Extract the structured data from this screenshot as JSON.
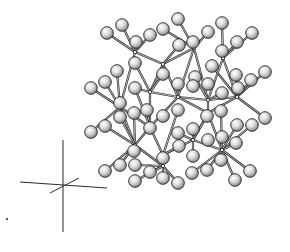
{
  "figure": {
    "title": "",
    "colors": {
      "background": "#ffffff",
      "atom_fill_light": "#f2f2f2",
      "atom_fill_dark": "#8a8a8a",
      "atom_outline": "#1f1f1f",
      "bond": "#2a2a2a",
      "axis": "#2b2b2b"
    },
    "atom_radius": 6.3,
    "atoms": [
      [
        107,
        33
      ],
      [
        122,
        25
      ],
      [
        136,
        42
      ],
      [
        150,
        35
      ],
      [
        163,
        29
      ],
      [
        178,
        19
      ],
      [
        193,
        42
      ],
      [
        208,
        32
      ],
      [
        222,
        23
      ],
      [
        252,
        33
      ],
      [
        237,
        42
      ],
      [
        222,
        51
      ],
      [
        179,
        45
      ],
      [
        135,
        63
      ],
      [
        117,
        71
      ],
      [
        195,
        77
      ],
      [
        212,
        66
      ],
      [
        236,
        75
      ],
      [
        265,
        72
      ],
      [
        251,
        80
      ],
      [
        91,
        88
      ],
      [
        105,
        82
      ],
      [
        135,
        88
      ],
      [
        163,
        74
      ],
      [
        178,
        84
      ],
      [
        193,
        86
      ],
      [
        208,
        84
      ],
      [
        222,
        93
      ],
      [
        238,
        88
      ],
      [
        221,
        111
      ],
      [
        207,
        116
      ],
      [
        178,
        110
      ],
      [
        163,
        116
      ],
      [
        147,
        110
      ],
      [
        134,
        113
      ],
      [
        120,
        103
      ],
      [
        265,
        118
      ],
      [
        252,
        125
      ],
      [
        237,
        125
      ],
      [
        91,
        132
      ],
      [
        105,
        126
      ],
      [
        120,
        117
      ],
      [
        150,
        128
      ],
      [
        178,
        133
      ],
      [
        193,
        129
      ],
      [
        208,
        140
      ],
      [
        222,
        137
      ],
      [
        236,
        143
      ],
      [
        134,
        151
      ],
      [
        163,
        158
      ],
      [
        193,
        156
      ],
      [
        179,
        146
      ],
      [
        105,
        171
      ],
      [
        120,
        165
      ],
      [
        135,
        165
      ],
      [
        150,
        172
      ],
      [
        192,
        173
      ],
      [
        207,
        170
      ],
      [
        221,
        160
      ],
      [
        235,
        180
      ],
      [
        250,
        171
      ],
      [
        135,
        181
      ],
      [
        178,
        183
      ],
      [
        163,
        178
      ]
    ],
    "nodes": [
      [
        135,
        52
      ],
      [
        194,
        48
      ],
      [
        223,
        58
      ],
      [
        163,
        64
      ],
      [
        150,
        92
      ],
      [
        120,
        107
      ],
      [
        178,
        97
      ],
      [
        208,
        100
      ],
      [
        237,
        97
      ],
      [
        150,
        127
      ],
      [
        208,
        113
      ],
      [
        135,
        145
      ],
      [
        193,
        140
      ],
      [
        163,
        155
      ],
      [
        222,
        150
      ],
      [
        163,
        166
      ]
    ],
    "bonds": [
      [
        107,
        33,
        135,
        52
      ],
      [
        122,
        25,
        135,
        52
      ],
      [
        136,
        42,
        135,
        52
      ],
      [
        150,
        35,
        135,
        52
      ],
      [
        178,
        19,
        194,
        48
      ],
      [
        193,
        42,
        194,
        48
      ],
      [
        208,
        32,
        194,
        48
      ],
      [
        163,
        29,
        194,
        48
      ],
      [
        222,
        23,
        223,
        58
      ],
      [
        237,
        42,
        223,
        58
      ],
      [
        252,
        33,
        223,
        58
      ],
      [
        222,
        51,
        223,
        58
      ],
      [
        135,
        52,
        163,
        64
      ],
      [
        194,
        48,
        163,
        64
      ],
      [
        179,
        45,
        163,
        64
      ],
      [
        163,
        64,
        150,
        92
      ],
      [
        163,
        64,
        178,
        97
      ],
      [
        135,
        52,
        120,
        107
      ],
      [
        135,
        63,
        150,
        92
      ],
      [
        117,
        71,
        120,
        107
      ],
      [
        91,
        88,
        120,
        107
      ],
      [
        105,
        82,
        120,
        107
      ],
      [
        194,
        48,
        178,
        97
      ],
      [
        194,
        48,
        208,
        100
      ],
      [
        195,
        77,
        208,
        100
      ],
      [
        212,
        66,
        237,
        97
      ],
      [
        223,
        58,
        237,
        97
      ],
      [
        223,
        58,
        208,
        100
      ],
      [
        265,
        72,
        237,
        97
      ],
      [
        251,
        80,
        237,
        97
      ],
      [
        236,
        75,
        237,
        97
      ],
      [
        150,
        92,
        178,
        97
      ],
      [
        178,
        97,
        208,
        100
      ],
      [
        208,
        100,
        237,
        97
      ],
      [
        150,
        92,
        135,
        88
      ],
      [
        163,
        74,
        150,
        92
      ],
      [
        120,
        107,
        150,
        127
      ],
      [
        150,
        92,
        150,
        127
      ],
      [
        178,
        97,
        150,
        127
      ],
      [
        178,
        97,
        208,
        113
      ],
      [
        208,
        100,
        208,
        113
      ],
      [
        237,
        97,
        208,
        113
      ],
      [
        120,
        107,
        135,
        145
      ],
      [
        91,
        132,
        120,
        107
      ],
      [
        105,
        126,
        135,
        145
      ],
      [
        120,
        117,
        135,
        145
      ],
      [
        134,
        113,
        135,
        145
      ],
      [
        150,
        127,
        163,
        155
      ],
      [
        150,
        127,
        135,
        145
      ],
      [
        178,
        110,
        163,
        155
      ],
      [
        147,
        110,
        150,
        127
      ],
      [
        208,
        113,
        193,
        140
      ],
      [
        208,
        113,
        222,
        150
      ],
      [
        207,
        116,
        193,
        140
      ],
      [
        221,
        111,
        222,
        150
      ],
      [
        265,
        118,
        237,
        97
      ],
      [
        252,
        125,
        222,
        150
      ],
      [
        237,
        125,
        222,
        150
      ],
      [
        236,
        143,
        222,
        150
      ],
      [
        193,
        140,
        163,
        155
      ],
      [
        193,
        140,
        193,
        129
      ],
      [
        178,
        133,
        193,
        140
      ],
      [
        193,
        156,
        193,
        140
      ],
      [
        179,
        146,
        163,
        155
      ],
      [
        163,
        155,
        163,
        166
      ],
      [
        135,
        145,
        163,
        166
      ],
      [
        134,
        151,
        135,
        145
      ],
      [
        105,
        171,
        135,
        145
      ],
      [
        120,
        165,
        135,
        145
      ],
      [
        135,
        165,
        163,
        166
      ],
      [
        150,
        172,
        163,
        166
      ],
      [
        135,
        181,
        163,
        166
      ],
      [
        163,
        178,
        163,
        166
      ],
      [
        178,
        183,
        163,
        166
      ],
      [
        193,
        140,
        222,
        150
      ],
      [
        222,
        150,
        192,
        173
      ],
      [
        222,
        150,
        207,
        170
      ],
      [
        222,
        150,
        221,
        160
      ],
      [
        222,
        150,
        235,
        180
      ],
      [
        222,
        150,
        250,
        171
      ],
      [
        135,
        88,
        150,
        127
      ],
      [
        178,
        84,
        178,
        97
      ],
      [
        222,
        93,
        208,
        100
      ],
      [
        238,
        88,
        237,
        97
      ]
    ],
    "axes": {
      "vertical": [
        63,
        140,
        63,
        232
      ],
      "horizontal": [
        20,
        182,
        107,
        188
      ],
      "diagonal": [
        50,
        193,
        79,
        178
      ],
      "origin": [
        63,
        185
      ]
    },
    "stray_mark": [
      7,
      219
    ]
  }
}
